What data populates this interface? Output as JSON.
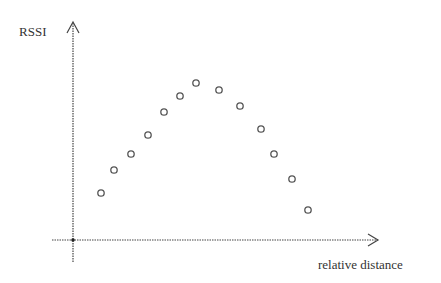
{
  "chart_data": {
    "type": "scatter",
    "title": "",
    "xlabel": "relative distance",
    "ylabel": "RSSI",
    "grid": false,
    "legend": null,
    "axis_ticks": "none",
    "x": [
      1,
      2,
      3,
      4,
      5,
      6,
      7,
      8,
      9,
      10,
      11,
      12,
      13
    ],
    "values": [
      47,
      70,
      86,
      105,
      128,
      144,
      157,
      150,
      134,
      111,
      86,
      61,
      30
    ],
    "pixel_points": [
      [
        101,
        193
      ],
      [
        114,
        170
      ],
      [
        131,
        154
      ],
      [
        148,
        135
      ],
      [
        164,
        112
      ],
      [
        180,
        96
      ],
      [
        196,
        83
      ],
      [
        219,
        90
      ],
      [
        240,
        106
      ],
      [
        261,
        129
      ],
      [
        274,
        154
      ],
      [
        292,
        179
      ],
      [
        308,
        210
      ]
    ],
    "marker": "hollow-circle",
    "colors": {
      "axis": "#444444",
      "marker": "#555555",
      "text": "#333333"
    }
  },
  "labels": {
    "y_axis": "RSSI",
    "x_axis": "relative distance"
  }
}
